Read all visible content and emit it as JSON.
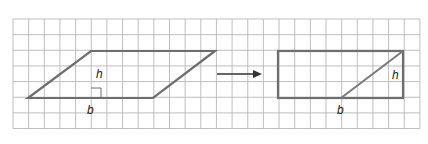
{
  "diagram": {
    "grid": {
      "x0": 13,
      "y0": 19,
      "cols": 26,
      "rows": 7,
      "cell": 15.65,
      "color": "#b8b8b8"
    },
    "parallelogram": {
      "points": [
        [
          28,
          98
        ],
        [
          153,
          98
        ],
        [
          215,
          51
        ],
        [
          91,
          51
        ]
      ],
      "height_line": {
        "x": 91,
        "y1": 51,
        "y2": 98
      },
      "right_angle_marker": {
        "x": 91,
        "y": 98,
        "size": 10
      },
      "labels": {
        "height": "h",
        "base": "b"
      },
      "stroke": "#6e6e6e"
    },
    "arrow": {
      "x1": 217,
      "y1": 74,
      "x2": 262,
      "y2": 74,
      "color": "#333333"
    },
    "rectangle": {
      "x": 278,
      "y": 51,
      "width": 125,
      "height": 47,
      "diagonal": {
        "x1": 341,
        "y1": 98,
        "x2": 403,
        "y2": 51
      },
      "labels": {
        "height": "h",
        "base": "b"
      },
      "stroke": "#6e6e6e"
    }
  }
}
